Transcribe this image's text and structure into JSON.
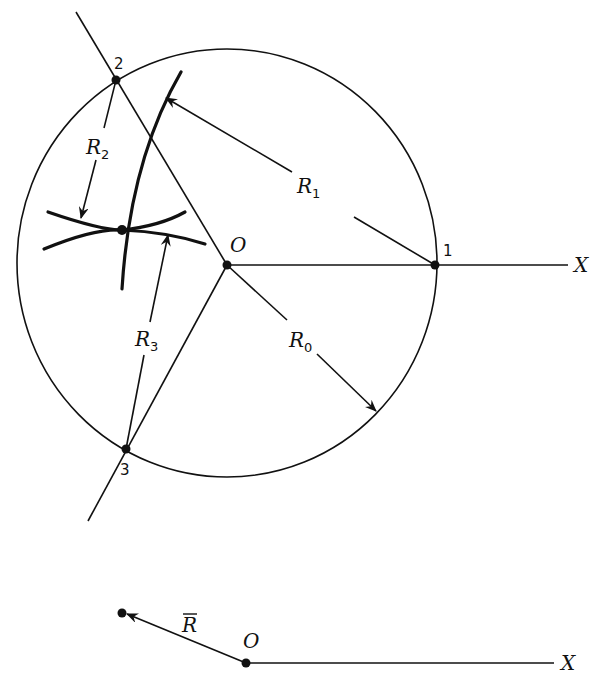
{
  "figure": {
    "main": {
      "origin_label": "O",
      "axis_label": "X",
      "points": [
        {
          "id": "1",
          "label": "1"
        },
        {
          "id": "2",
          "label": "2"
        },
        {
          "id": "3",
          "label": "3"
        }
      ],
      "radii": [
        {
          "id": "R0",
          "base": "R",
          "sub": "0"
        },
        {
          "id": "R1",
          "base": "R",
          "sub": "1"
        },
        {
          "id": "R2",
          "base": "R",
          "sub": "2"
        },
        {
          "id": "R3",
          "base": "R",
          "sub": "3"
        }
      ]
    },
    "vector_inset": {
      "origin_label": "O",
      "axis_label": "X",
      "vector_label": "R",
      "vector_overbar": true
    }
  }
}
